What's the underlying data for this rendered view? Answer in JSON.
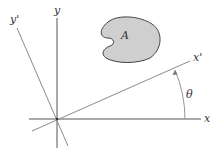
{
  "diagram": {
    "labels": {
      "x_axis": "x",
      "y_axis": "y",
      "x_prime_axis": "x'",
      "y_prime_axis": "y'",
      "area": "A",
      "angle": "θ"
    },
    "colors": {
      "axis": "#555555",
      "rotated_axis": "#8a8a8a",
      "area_fill": "#cfcfcf",
      "area_stroke": "#444444",
      "text": "#333333"
    }
  }
}
